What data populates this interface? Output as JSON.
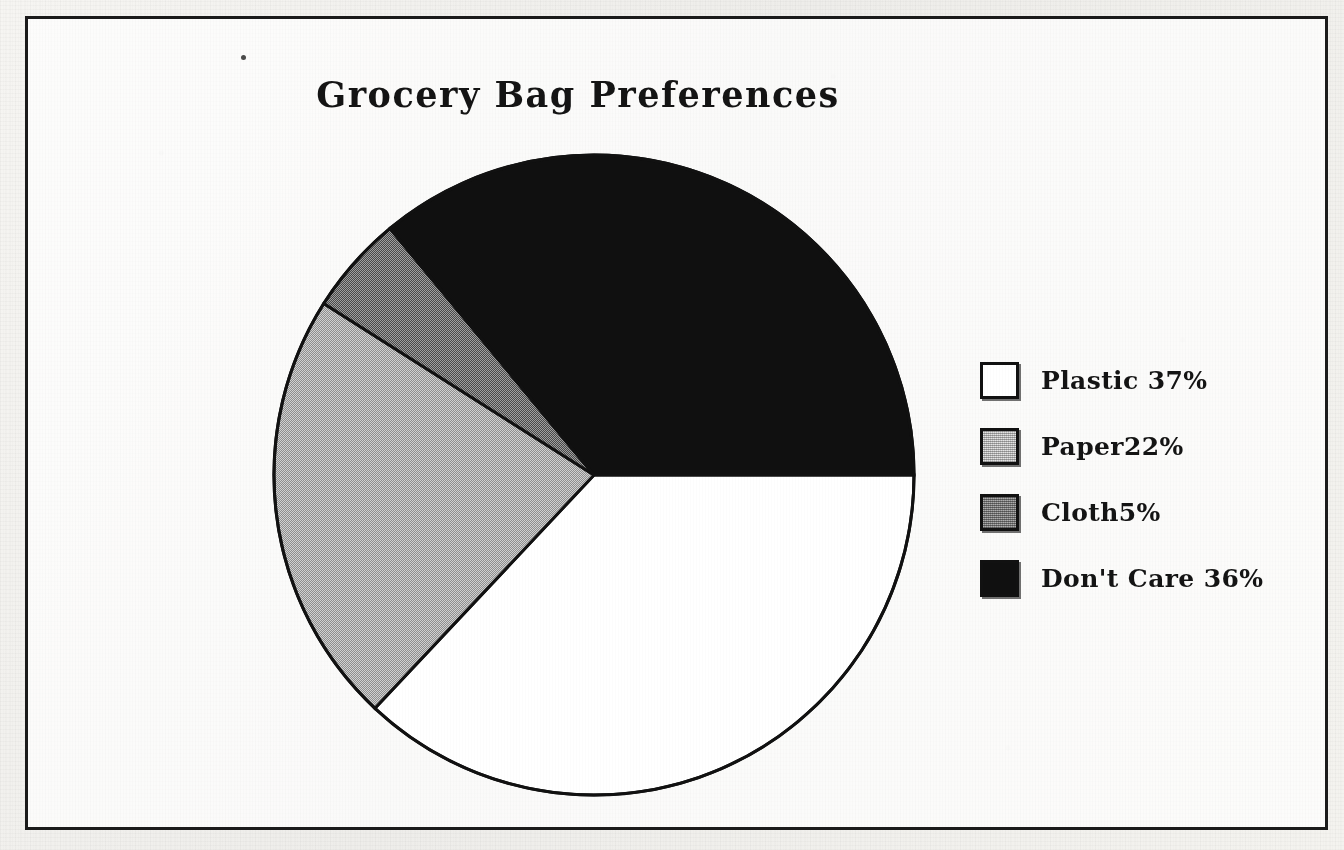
{
  "document": {
    "background_color": "#f4f3f0",
    "frame_color": "#1b1b1b",
    "stray_mark_name": "scan-speck"
  },
  "chart_data": {
    "type": "pie",
    "title": "Grocery Bag Preferences",
    "xlabel": "",
    "ylabel": "",
    "grid": false,
    "legend_position": "right",
    "start_angle_deg": 0,
    "direction": "clockwise",
    "categories": [
      "Plastic",
      "Paper",
      "Cloth",
      "Don't Care"
    ],
    "values": [
      37,
      22,
      5,
      36
    ],
    "unit": "%",
    "slices": [
      {
        "label": "Plastic",
        "value": 37,
        "percent_text": "37%",
        "color": "#ffffff",
        "fill_style": "solid-white",
        "start_deg": 0,
        "end_deg": 133.2
      },
      {
        "label": "Paper",
        "value": 22,
        "percent_text": "22%",
        "color": "#c6c6c6",
        "fill_style": "light-dither",
        "start_deg": 133.2,
        "end_deg": 212.4
      },
      {
        "label": "Cloth",
        "value": 5,
        "percent_text": "5%",
        "color": "#8b8b8b",
        "fill_style": "dark-dither",
        "start_deg": 212.4,
        "end_deg": 230.4
      },
      {
        "label": "Don't Care",
        "value": 36,
        "percent_text": "36%",
        "color": "#101010",
        "fill_style": "solid-black",
        "start_deg": 230.4,
        "end_deg": 360
      }
    ],
    "legend": [
      {
        "label": "Plastic 37%",
        "swatch": "white"
      },
      {
        "label": "Paper22%",
        "swatch": "light-gray"
      },
      {
        "label": "Cloth5%",
        "swatch": "dark-gray"
      },
      {
        "label": "Don't Care 36%",
        "swatch": "black"
      }
    ]
  },
  "geometry": {
    "center_x": 322,
    "center_y": 322,
    "radius": 320
  }
}
